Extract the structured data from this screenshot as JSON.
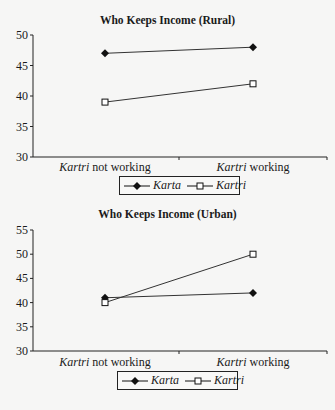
{
  "chart_data": [
    {
      "type": "line",
      "title": "Who Keeps Income (Rural)",
      "categories": [
        "Kartri not working",
        "Kartri working"
      ],
      "category_parts": [
        {
          "italic": "Kartri",
          "rest": " not working"
        },
        {
          "italic": "Kartri",
          "rest": " working"
        }
      ],
      "series": [
        {
          "name": "Karta",
          "marker": "filled-diamond",
          "values": [
            47,
            48
          ]
        },
        {
          "name": "Kartri",
          "marker": "open-square",
          "values": [
            39,
            42
          ]
        }
      ],
      "ylim": [
        30,
        50
      ],
      "yticks": [
        50,
        45,
        40,
        35,
        30
      ],
      "xlabel": "",
      "ylabel": "",
      "grid": false,
      "legend_position": "bottom-center"
    },
    {
      "type": "line",
      "title": "Who Keeps Income (Urban)",
      "categories": [
        "Kartri not working",
        "Kartri working"
      ],
      "category_parts": [
        {
          "italic": "Kartri",
          "rest": " not working"
        },
        {
          "italic": "Kartri",
          "rest": " working"
        }
      ],
      "series": [
        {
          "name": "Karta",
          "marker": "filled-diamond",
          "values": [
            41,
            42
          ]
        },
        {
          "name": "Kartri",
          "marker": "open-square",
          "values": [
            40,
            50
          ]
        }
      ],
      "ylim": [
        30,
        55
      ],
      "yticks": [
        55,
        50,
        45,
        40,
        35,
        30
      ],
      "xlabel": "",
      "ylabel": "",
      "grid": false,
      "legend_position": "bottom-center"
    }
  ],
  "legend": {
    "karta_label": "Karta",
    "kartri_label": "Kartri"
  }
}
